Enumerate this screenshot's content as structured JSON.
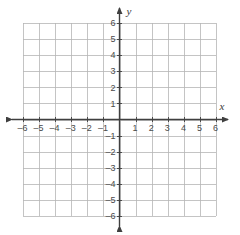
{
  "chart_data": {
    "type": "scatter",
    "title": "",
    "subtitle": "",
    "xlabel": "x",
    "ylabel": "y",
    "xlim": [
      -6,
      6
    ],
    "ylim": [
      -6,
      6
    ],
    "x_ticks": [
      -6,
      -5,
      -4,
      -3,
      -2,
      -1,
      1,
      2,
      3,
      4,
      5,
      6
    ],
    "y_ticks": [
      6,
      5,
      4,
      3,
      2,
      1,
      -1,
      -2,
      -3,
      -4,
      -5,
      -6
    ],
    "x_tick_labels": [
      "–6",
      "–5",
      "–4",
      "–3",
      "–2",
      "–1",
      "1",
      "2",
      "3",
      "4",
      "5",
      "6"
    ],
    "y_tick_labels": [
      "6",
      "5",
      "4",
      "3",
      "2",
      "1",
      "–1",
      "–2",
      "–3",
      "–4",
      "–5",
      "–6"
    ],
    "grid": true,
    "grid_step": 1,
    "legend": "none",
    "series": [],
    "values": [],
    "annotations": [],
    "origin_label": ""
  },
  "figure": {
    "background_color": "#ffffff",
    "grid_color": "#b5b5b5",
    "axis_color": "#3f3f3f",
    "tick_label_color": "#4a4a4a",
    "axis_name_color": "#3a3a3a",
    "axis_label_x": "x",
    "axis_label_y": "y",
    "x_axis_arrows": "both",
    "y_axis_arrows": "both"
  }
}
